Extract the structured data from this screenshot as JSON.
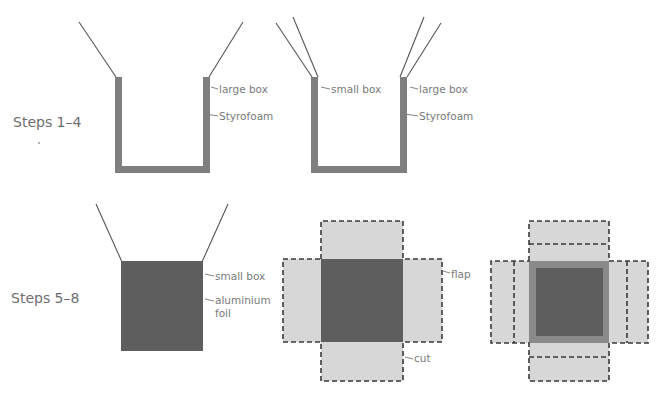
{
  "figure": {
    "row1": {
      "label": "Steps 1–4",
      "diagram1": {
        "labels": {
          "outer_box": "large box",
          "insulation": "Styrofoam"
        }
      },
      "diagram2": {
        "labels": {
          "inner_box": "small box",
          "outer_box": "large box",
          "insulation": "Styrofoam"
        }
      }
    },
    "row2": {
      "label": "Steps 5–8",
      "diagram3": {
        "labels": {
          "box": "small box",
          "foil_line1": "aluminium",
          "foil_line2": "foil"
        }
      },
      "diagram4": {
        "labels": {
          "flap": "flap",
          "cut": "cut"
        }
      },
      "diagram5": {
        "labels": {}
      }
    },
    "colors": {
      "wall_gray": "#7f7f7f",
      "dark_fill": "#5e5e5e",
      "flap_fill": "#d7d7d7",
      "dash_stroke": "#3a3a3a",
      "text_gray": "#7a7a7a"
    }
  }
}
